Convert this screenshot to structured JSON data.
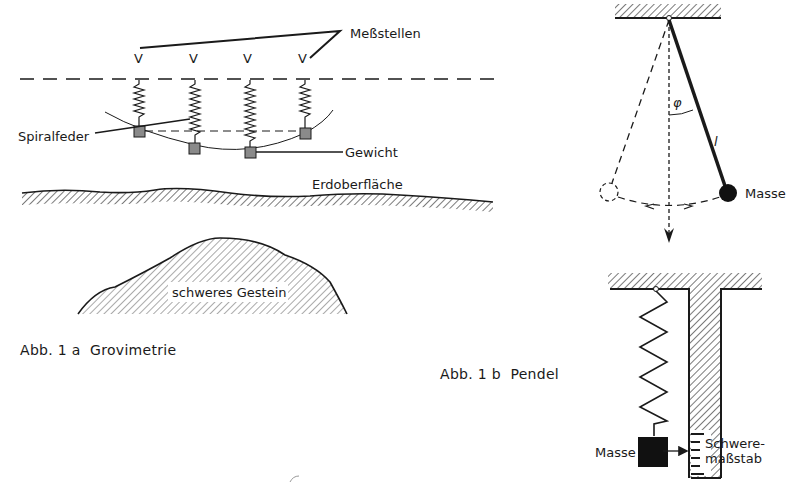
{
  "figure_a": {
    "caption": "Abb. 1 a  Grovimetrie",
    "labels": {
      "measuring_points": "Meßstellen",
      "spiral_spring": "Spiralfeder",
      "weight": "Gewicht",
      "earth_surface": "Erdoberfläche",
      "heavy_rock": "schweres Gestein"
    },
    "station_marker_glyph": "V",
    "station_count": 4
  },
  "figure_b": {
    "caption": "Abb. 1 b  Pendel",
    "pendulum": {
      "angle_symbol": "φ",
      "length_symbol": "l",
      "mass_label": "Masse"
    },
    "spring_gauge": {
      "mass_label": "Masse",
      "scale_label_line1": "Schwere-",
      "scale_label_line2": "maßstab"
    }
  },
  "colors": {
    "ink": "#1a1a1a",
    "weight_fill": "#8a8a8a",
    "background": "#ffffff"
  }
}
